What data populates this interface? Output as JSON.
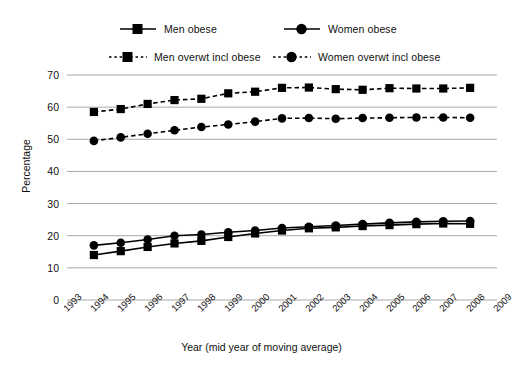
{
  "chart_data": {
    "type": "line",
    "title": "",
    "xlabel": "Year (mid year of moving average)",
    "ylabel": "Percentage",
    "x": [
      1993,
      1994,
      1995,
      1996,
      1997,
      1998,
      1999,
      2000,
      2001,
      2002,
      2003,
      2004,
      2005,
      2006,
      2007,
      2008,
      2009
    ],
    "xticklabels": [
      "1993",
      "1994",
      "1995",
      "1996",
      "1997",
      "1998",
      "1999",
      "2000",
      "2001",
      "2002",
      "2003",
      "2004",
      "2005",
      "2006",
      "2007",
      "2008",
      "2009"
    ],
    "xlim": [
      1993,
      2009
    ],
    "ylim": [
      0,
      70
    ],
    "yticks": [
      0,
      10,
      20,
      30,
      40,
      50,
      60,
      70
    ],
    "yticklabels": [
      "0",
      "10",
      "20",
      "30",
      "40",
      "50",
      "60",
      "70"
    ],
    "grid": "horizontal",
    "legend_position": "top",
    "series": [
      {
        "name": "Men obese",
        "marker": "square",
        "linestyle": "solid",
        "color": "#000000",
        "x": [
          1994,
          1995,
          1996,
          1997,
          1998,
          1999,
          2000,
          2001,
          2002,
          2003,
          2004,
          2005,
          2006,
          2007,
          2008
        ],
        "values": [
          14.0,
          15.2,
          16.5,
          17.6,
          18.4,
          19.6,
          20.7,
          21.6,
          22.3,
          22.6,
          23.0,
          23.3,
          23.6,
          23.8,
          23.7
        ]
      },
      {
        "name": "Women obese",
        "marker": "circle",
        "linestyle": "solid",
        "color": "#000000",
        "x": [
          1994,
          1995,
          1996,
          1997,
          1998,
          1999,
          2000,
          2001,
          2002,
          2003,
          2004,
          2005,
          2006,
          2007,
          2008
        ],
        "values": [
          17.0,
          17.8,
          18.8,
          20.0,
          20.4,
          21.1,
          21.6,
          22.4,
          22.8,
          23.2,
          23.6,
          24.0,
          24.3,
          24.5,
          24.6
        ]
      },
      {
        "name": "Men overwt incl obese",
        "marker": "square",
        "linestyle": "dashed",
        "color": "#000000",
        "x": [
          1994,
          1995,
          1996,
          1997,
          1998,
          1999,
          2000,
          2001,
          2002,
          2003,
          2004,
          2005,
          2006,
          2007,
          2008
        ],
        "values": [
          58.5,
          59.4,
          61.0,
          62.2,
          62.6,
          64.3,
          64.8,
          66.0,
          66.1,
          65.6,
          65.4,
          65.9,
          65.8,
          65.8,
          66.0
        ]
      },
      {
        "name": "Women overwt incl obese",
        "marker": "circle",
        "linestyle": "dashed",
        "color": "#000000",
        "x": [
          1994,
          1995,
          1996,
          1997,
          1998,
          1999,
          2000,
          2001,
          2002,
          2003,
          2004,
          2005,
          2006,
          2007,
          2008
        ],
        "values": [
          49.5,
          50.6,
          51.7,
          52.8,
          53.8,
          54.6,
          55.5,
          56.5,
          56.6,
          56.4,
          56.6,
          56.7,
          56.8,
          56.8,
          56.7
        ]
      }
    ]
  },
  "legend": {
    "items": [
      {
        "label": "Men obese",
        "marker": "square",
        "linestyle": "solid"
      },
      {
        "label": "Women obese",
        "marker": "circle",
        "linestyle": "solid"
      },
      {
        "label": "Men overwt incl obese",
        "marker": "square",
        "linestyle": "dashed"
      },
      {
        "label": "Women overwt incl obese",
        "marker": "circle",
        "linestyle": "dashed"
      }
    ]
  },
  "colors": {
    "ink": "#000000",
    "grid": "#a8a8a8",
    "text": "#111111",
    "background": "#ffffff"
  }
}
